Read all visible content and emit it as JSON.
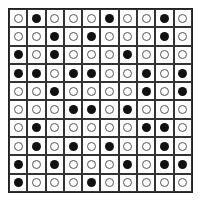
{
  "grid": {
    "rows": 10,
    "cols": 10,
    "legend": {
      "1": "filled-circle",
      "0": "empty-circle"
    },
    "cells": [
      [
        0,
        1,
        0,
        0,
        0,
        1,
        0,
        0,
        1,
        0
      ],
      [
        0,
        0,
        1,
        0,
        1,
        0,
        0,
        0,
        1,
        0
      ],
      [
        1,
        0,
        1,
        0,
        0,
        0,
        1,
        0,
        0,
        0
      ],
      [
        1,
        1,
        0,
        1,
        1,
        0,
        0,
        1,
        0,
        1
      ],
      [
        0,
        0,
        1,
        0,
        0,
        0,
        0,
        1,
        0,
        1
      ],
      [
        0,
        0,
        0,
        1,
        1,
        0,
        1,
        0,
        0,
        0
      ],
      [
        0,
        1,
        0,
        0,
        0,
        0,
        0,
        1,
        1,
        0
      ],
      [
        0,
        1,
        0,
        1,
        0,
        1,
        0,
        0,
        1,
        0
      ],
      [
        1,
        0,
        1,
        0,
        0,
        0,
        1,
        0,
        1,
        1
      ],
      [
        1,
        0,
        0,
        0,
        1,
        0,
        0,
        0,
        0,
        0
      ]
    ]
  }
}
